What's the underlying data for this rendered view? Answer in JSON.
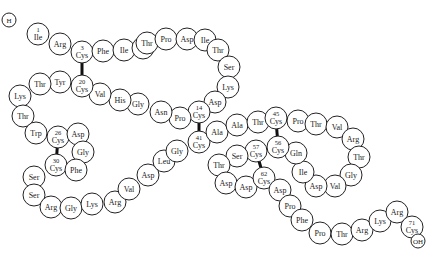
{
  "diagram": {
    "residue_radius": 11,
    "colors": {
      "stroke": "#222222",
      "fill": "#ffffff",
      "bond": "#111111"
    },
    "residues": [
      {
        "id": "H",
        "label": "H",
        "num": "",
        "x": 9,
        "y": 20,
        "r": 7
      },
      {
        "id": "r1",
        "label": "Ile",
        "num": "1",
        "x": 38,
        "y": 34
      },
      {
        "id": "r2",
        "label": "Arg",
        "num": "",
        "x": 60,
        "y": 44
      },
      {
        "id": "r3",
        "label": "Cys",
        "num": "3",
        "x": 82,
        "y": 52
      },
      {
        "id": "r4",
        "label": "Phe",
        "num": "",
        "x": 103,
        "y": 51
      },
      {
        "id": "r5",
        "label": "Ile",
        "num": "",
        "x": 124,
        "y": 50
      },
      {
        "id": "r6",
        "label": "Thr",
        "num": "",
        "x": 143,
        "y": 48
      },
      {
        "id": "r7",
        "label": "Thr",
        "num": "",
        "x": 147,
        "y": 43
      },
      {
        "id": "r8",
        "label": "Pro",
        "num": "",
        "x": 166,
        "y": 39
      },
      {
        "id": "r9",
        "label": "Asp",
        "num": "",
        "x": 187,
        "y": 39
      },
      {
        "id": "r10",
        "label": "Ile",
        "num": "",
        "x": 205,
        "y": 40
      },
      {
        "id": "r11",
        "label": "Thr",
        "num": "",
        "x": 218,
        "y": 50
      },
      {
        "id": "r12",
        "label": "Ser",
        "num": "",
        "x": 229,
        "y": 67
      },
      {
        "id": "r13",
        "label": "Lys",
        "num": "",
        "x": 228,
        "y": 87
      },
      {
        "id": "r14",
        "label": "Asp",
        "num": "",
        "x": 215,
        "y": 102
      },
      {
        "id": "r15",
        "label": "Cys",
        "num": "14",
        "x": 199,
        "y": 112
      },
      {
        "id": "r16",
        "label": "Pro",
        "num": "",
        "x": 180,
        "y": 118
      },
      {
        "id": "r17",
        "label": "Asn",
        "num": "",
        "x": 161,
        "y": 112
      },
      {
        "id": "r18",
        "label": "Gly",
        "num": "",
        "x": 138,
        "y": 104
      },
      {
        "id": "r19",
        "label": "His",
        "num": "",
        "x": 120,
        "y": 100
      },
      {
        "id": "r20",
        "label": "Val",
        "num": "",
        "x": 100,
        "y": 94
      },
      {
        "id": "r21",
        "label": "Cys",
        "num": "20",
        "x": 82,
        "y": 86
      },
      {
        "id": "r22",
        "label": "Tyr",
        "num": "",
        "x": 60,
        "y": 82
      },
      {
        "id": "r23",
        "label": "Thr",
        "num": "",
        "x": 40,
        "y": 84
      },
      {
        "id": "r24",
        "label": "Lys",
        "num": "",
        "x": 20,
        "y": 96
      },
      {
        "id": "r25",
        "label": "Thr",
        "num": "",
        "x": 23,
        "y": 116
      },
      {
        "id": "r26",
        "label": "Trp",
        "num": "",
        "x": 36,
        "y": 133
      },
      {
        "id": "r27",
        "label": "Cys",
        "num": "26",
        "x": 58,
        "y": 137
      },
      {
        "id": "r28",
        "label": "Asp",
        "num": "",
        "x": 78,
        "y": 134
      },
      {
        "id": "r29",
        "label": "Gly",
        "num": "",
        "x": 83,
        "y": 152
      },
      {
        "id": "r30",
        "label": "Cys",
        "num": "30",
        "x": 56,
        "y": 165
      },
      {
        "id": "r31",
        "label": "Phe",
        "num": "",
        "x": 76,
        "y": 170
      },
      {
        "id": "r32",
        "label": "Ser",
        "num": "",
        "x": 34,
        "y": 177
      },
      {
        "id": "r33",
        "label": "Ser",
        "num": "",
        "x": 34,
        "y": 195
      },
      {
        "id": "r34",
        "label": "Arg",
        "num": "",
        "x": 51,
        "y": 207
      },
      {
        "id": "r35",
        "label": "Gly",
        "num": "",
        "x": 71,
        "y": 208
      },
      {
        "id": "r36",
        "label": "Lys",
        "num": "",
        "x": 92,
        "y": 204
      },
      {
        "id": "r37",
        "label": "Arg",
        "num": "",
        "x": 115,
        "y": 202
      },
      {
        "id": "r38",
        "label": "Val",
        "num": "",
        "x": 129,
        "y": 189
      },
      {
        "id": "r39",
        "label": "Asp",
        "num": "",
        "x": 148,
        "y": 175
      },
      {
        "id": "r40",
        "label": "Leu",
        "num": "",
        "x": 164,
        "y": 161
      },
      {
        "id": "r41",
        "label": "Gly",
        "num": "",
        "x": 177,
        "y": 151
      },
      {
        "id": "r42",
        "label": "Cys",
        "num": "41",
        "x": 199,
        "y": 142
      },
      {
        "id": "r43",
        "label": "Ala",
        "num": "",
        "x": 217,
        "y": 132
      },
      {
        "id": "r44",
        "label": "Ala",
        "num": "",
        "x": 237,
        "y": 125
      },
      {
        "id": "r45",
        "label": "Thr",
        "num": "",
        "x": 258,
        "y": 122
      },
      {
        "id": "r46",
        "label": "Cys",
        "num": "45",
        "x": 276,
        "y": 118
      },
      {
        "id": "r47",
        "label": "Pro",
        "num": "",
        "x": 298,
        "y": 121
      },
      {
        "id": "r48",
        "label": "Thr",
        "num": "",
        "x": 316,
        "y": 124
      },
      {
        "id": "r49",
        "label": "Val",
        "num": "",
        "x": 337,
        "y": 127
      },
      {
        "id": "r50",
        "label": "Arg",
        "num": "",
        "x": 353,
        "y": 139
      },
      {
        "id": "r51",
        "label": "Thr",
        "num": "",
        "x": 359,
        "y": 157
      },
      {
        "id": "r52",
        "label": "Gly",
        "num": "",
        "x": 351,
        "y": 175
      },
      {
        "id": "r53",
        "label": "Val",
        "num": "",
        "x": 335,
        "y": 186
      },
      {
        "id": "r54",
        "label": "Asp",
        "num": "",
        "x": 316,
        "y": 186
      },
      {
        "id": "r55",
        "label": "Ile",
        "num": "",
        "x": 303,
        "y": 172
      },
      {
        "id": "r56",
        "label": "Gln",
        "num": "",
        "x": 296,
        "y": 153
      },
      {
        "id": "r57",
        "label": "Cys",
        "num": "56",
        "x": 278,
        "y": 147
      },
      {
        "id": "r58",
        "label": "Cys",
        "num": "57",
        "x": 256,
        "y": 151
      },
      {
        "id": "r59",
        "label": "Ser",
        "num": "",
        "x": 237,
        "y": 156
      },
      {
        "id": "r60",
        "label": "Thr",
        "num": "",
        "x": 219,
        "y": 165
      },
      {
        "id": "r61",
        "label": "Asp",
        "num": "",
        "x": 226,
        "y": 183
      },
      {
        "id": "r62",
        "label": "Asp",
        "num": "",
        "x": 246,
        "y": 187
      },
      {
        "id": "r63",
        "label": "Cys",
        "num": "62",
        "x": 264,
        "y": 178
      },
      {
        "id": "r64",
        "label": "Asp",
        "num": "",
        "x": 280,
        "y": 190
      },
      {
        "id": "r65",
        "label": "Pro",
        "num": "",
        "x": 290,
        "y": 206
      },
      {
        "id": "r66",
        "label": "Phe",
        "num": "",
        "x": 302,
        "y": 220
      },
      {
        "id": "r67",
        "label": "Pro",
        "num": "",
        "x": 320,
        "y": 233
      },
      {
        "id": "r68",
        "label": "Thr",
        "num": "",
        "x": 342,
        "y": 234
      },
      {
        "id": "r69",
        "label": "Arg",
        "num": "",
        "x": 362,
        "y": 230
      },
      {
        "id": "r70",
        "label": "Lys",
        "num": "",
        "x": 380,
        "y": 221
      },
      {
        "id": "r71",
        "label": "Arg",
        "num": "",
        "x": 397,
        "y": 212
      },
      {
        "id": "r72",
        "label": "Cys",
        "num": "71",
        "x": 412,
        "y": 227
      },
      {
        "id": "OH",
        "label": "OH",
        "num": "",
        "x": 418,
        "y": 241,
        "r": 7
      }
    ],
    "disulfide_bonds": [
      {
        "from": "r3",
        "to": "r21",
        "label": "3-20"
      },
      {
        "from": "r15",
        "to": "r42",
        "label": "14-41"
      },
      {
        "from": "r27",
        "to": "r30",
        "label": "26-30"
      },
      {
        "from": "r46",
        "to": "r57",
        "label": "45-56"
      },
      {
        "from": "r58",
        "to": "r63",
        "label": "57-62"
      }
    ]
  }
}
